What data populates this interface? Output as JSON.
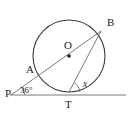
{
  "figure": {
    "background_color": "#ffffff",
    "stroke_color": "#3a3a3a",
    "label_color": "#1c1c1c"
  },
  "labels": {
    "point_P": "P",
    "point_A": "A",
    "point_O": "O",
    "point_B": "B",
    "point_T": "T",
    "angle_at_P": "36°",
    "angle_at_T": "x"
  },
  "geometry": {
    "circle": {
      "cx": 69,
      "cy": 56,
      "r": 36
    },
    "center_dot": {
      "cx": 69,
      "cy": 56,
      "r": 1.8
    },
    "points": {
      "P": {
        "x": 12,
        "y": 95
      },
      "A": {
        "x": 36.5,
        "y": 72.5
      },
      "O": {
        "x": 69,
        "y": 56
      },
      "B": {
        "x": 100.5,
        "y": 31.5
      },
      "T": {
        "x": 69,
        "y": 92
      }
    },
    "segments": [
      {
        "name": "tangent-line-PT-extended",
        "x1": 10,
        "y1": 95,
        "x2": 126,
        "y2": 95
      },
      {
        "name": "secant-line-P-through-O-to-B",
        "x1": 11,
        "y1": 95,
        "x2": 101,
        "y2": 31
      },
      {
        "name": "chord-TB",
        "x1": 69,
        "y1": 92,
        "x2": 101,
        "y2": 31
      }
    ],
    "angle_arcs": [
      {
        "name": "arc-at-P",
        "cx": 12,
        "cy": 95,
        "r": 11
      },
      {
        "name": "arc-at-T",
        "cx": 69,
        "cy": 92,
        "r": 10
      }
    ]
  }
}
